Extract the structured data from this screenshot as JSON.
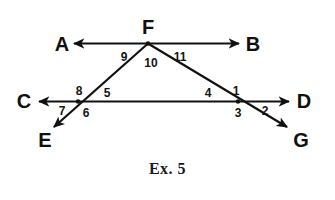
{
  "figure": {
    "caption": "Ex. 5",
    "stroke_color": "#111111",
    "text_color": "#101010",
    "background_color": "#ffffff",
    "stroke_width": 2,
    "point_labels": [
      {
        "name": "point-label-a",
        "text": "A",
        "x": 62,
        "y": 44
      },
      {
        "name": "point-label-b",
        "text": "B",
        "x": 253,
        "y": 44
      },
      {
        "name": "point-label-c",
        "text": "C",
        "x": 24,
        "y": 101
      },
      {
        "name": "point-label-d",
        "text": "D",
        "x": 304,
        "y": 101
      },
      {
        "name": "point-label-e",
        "text": "E",
        "x": 45,
        "y": 140
      },
      {
        "name": "point-label-f",
        "text": "F",
        "x": 148,
        "y": 27
      },
      {
        "name": "point-label-g",
        "text": "G",
        "x": 301,
        "y": 140
      }
    ],
    "angle_numbers": [
      {
        "name": "angle-number-9",
        "text": "9",
        "x": 124,
        "y": 57
      },
      {
        "name": "angle-number-10",
        "text": "10",
        "x": 151,
        "y": 63
      },
      {
        "name": "angle-number-11",
        "text": "11",
        "x": 180,
        "y": 57
      },
      {
        "name": "angle-number-8",
        "text": "8",
        "x": 79,
        "y": 91
      },
      {
        "name": "angle-number-5",
        "text": "5",
        "x": 107,
        "y": 93
      },
      {
        "name": "angle-number-7",
        "text": "7",
        "x": 62,
        "y": 111
      },
      {
        "name": "angle-number-6",
        "text": "6",
        "x": 86,
        "y": 113
      },
      {
        "name": "angle-number-4",
        "text": "4",
        "x": 208,
        "y": 93
      },
      {
        "name": "angle-number-1",
        "text": "1",
        "x": 236,
        "y": 91
      },
      {
        "name": "angle-number-3",
        "text": "3",
        "x": 238,
        "y": 113
      },
      {
        "name": "angle-number-2",
        "text": "2",
        "x": 265,
        "y": 111
      }
    ],
    "geometry": {
      "vertex_f": {
        "x": 148,
        "y": 43
      },
      "intersection_left": {
        "x": 78,
        "y": 101
      },
      "intersection_right": {
        "x": 238,
        "y": 101
      },
      "line_ab": {
        "y": 43,
        "arrow_a_x": 74,
        "arrow_b_x": 239
      },
      "line_cd": {
        "y": 101,
        "arrow_c_x": 39,
        "arrow_d_x": 289
      },
      "ray_fe_end": {
        "x": 54,
        "y": 127
      },
      "ray_fg_end": {
        "x": 287,
        "y": 127
      }
    },
    "diagram_description": "Two parallel horizontal lines AB and CD crossed by two transversal rays from point F, forming a triangle with numbered angles 1 through 11"
  }
}
